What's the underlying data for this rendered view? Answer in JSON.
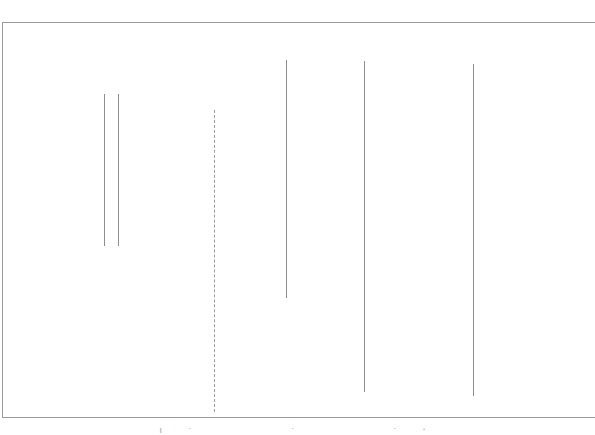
{
  "figure": {
    "background_color": "#ffffff",
    "width": 595,
    "height": 435,
    "caption_partial": "| +-----        + ----   +          ."
  },
  "frame": {
    "color": "#9a9a9a",
    "stroke_width": 1,
    "left": 2,
    "top": 22,
    "bottom": 417,
    "right_edge_visible": false,
    "edges": [
      {
        "name": "top-rule",
        "x": 2,
        "y": 22,
        "length": 593,
        "orientation": "horizontal"
      },
      {
        "name": "left-rule",
        "x": 2,
        "y": 22,
        "length": 396,
        "orientation": "vertical"
      },
      {
        "name": "bottom-rule",
        "x": 2,
        "y": 417,
        "length": 593,
        "orientation": "horizontal"
      }
    ]
  },
  "chart_data": {
    "type": "line",
    "title": "",
    "subtitle": "",
    "xlabel": "",
    "ylabel": "",
    "grid": false,
    "legend": "none",
    "xlim": [
      0,
      595
    ],
    "ylim": [
      435,
      0
    ],
    "orientation": "vertical-segments",
    "stroke_color": "#8e8e8e",
    "dash_color": "#9b9b9b",
    "categories": [
      "seg-1",
      "seg-2",
      "seg-3",
      "seg-4",
      "seg-5",
      "seg-6"
    ],
    "series": [
      {
        "name": "vertical-segments",
        "values": [
          152,
          152,
          302,
          238,
          331,
          332
        ]
      }
    ],
    "segments": [
      {
        "id": "seg-1",
        "x": 104,
        "y_top": 94,
        "y_bottom": 246,
        "length": 152,
        "style": "solid",
        "color": "#8e8e8e"
      },
      {
        "id": "seg-2",
        "x": 118,
        "y_top": 94,
        "y_bottom": 246,
        "length": 152,
        "style": "solid",
        "color": "#8e8e8e"
      },
      {
        "id": "seg-3",
        "x": 214,
        "y_top": 110,
        "y_bottom": 412,
        "length": 302,
        "style": "dashed",
        "color": "#9b9b9b"
      },
      {
        "id": "seg-4",
        "x": 286,
        "y_top": 60,
        "y_bottom": 298,
        "length": 238,
        "style": "solid",
        "color": "#8e8e8e"
      },
      {
        "id": "seg-5",
        "x": 364,
        "y_top": 61,
        "y_bottom": 392,
        "length": 331,
        "style": "solid",
        "color": "#8e8e8e"
      },
      {
        "id": "seg-6",
        "x": 473,
        "y_top": 64,
        "y_bottom": 396,
        "length": 332,
        "style": "solid",
        "color": "#8e8e8e"
      }
    ]
  }
}
